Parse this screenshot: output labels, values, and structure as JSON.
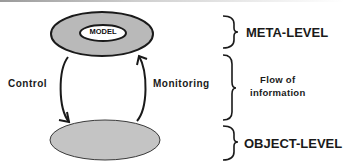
{
  "diagram": {
    "nodes": {
      "meta_level_ellipse": {
        "inner_label": "MODEL",
        "fill": "#b9b9b9"
      },
      "object_level_ellipse": {
        "fill": "#c4c4c4"
      }
    },
    "edges": {
      "control": {
        "label": "Control",
        "direction": "meta-to-object"
      },
      "monitoring": {
        "label": "Monitoring",
        "direction": "object-to-meta"
      }
    },
    "annotations": {
      "meta_level": "META-LEVEL",
      "flow_line1": "Flow of",
      "flow_line2": "information",
      "object_level": "OBJECT-LEVEL"
    },
    "colors": {
      "stroke": "#1a1a1a",
      "ellipse_fill": "#bdbdbd",
      "background": "#ffffff"
    }
  }
}
